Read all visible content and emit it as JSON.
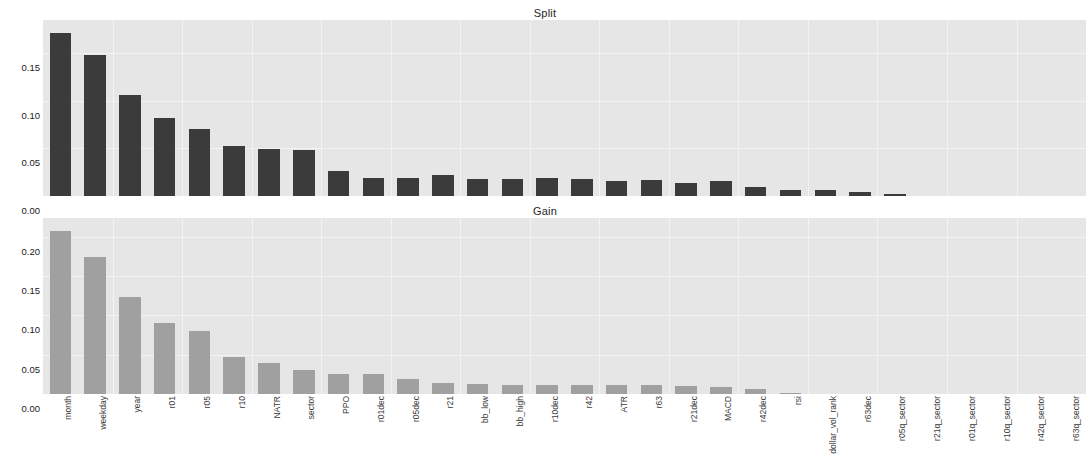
{
  "figure": {
    "width": 1090,
    "height": 472,
    "background": "#ffffff",
    "plot_background": "#e6e6e6",
    "grid_color": "#f3f3f3"
  },
  "panels": [
    {
      "id": "split",
      "title": "Split",
      "bar_color": "#3b3b3b",
      "ylim": [
        0,
        0.1845
      ],
      "yticks": [
        "0.00",
        "0.05",
        "0.10",
        "0.15"
      ],
      "ytick_values": [
        0.0,
        0.05,
        0.1,
        0.15
      ]
    },
    {
      "id": "gain",
      "title": "Gain",
      "bar_color": "#a0a0a0",
      "ylim": [
        0,
        0.224
      ],
      "yticks": [
        "0.00",
        "0.05",
        "0.10",
        "0.15",
        "0.20"
      ],
      "ytick_values": [
        0.0,
        0.05,
        0.1,
        0.15,
        0.2
      ]
    }
  ],
  "chart_data": [
    {
      "type": "bar",
      "title": "Split",
      "xlabel": "",
      "ylabel": "",
      "ylim": [
        0,
        0.1845
      ],
      "yticks": [
        0.0,
        0.05,
        0.1,
        0.15
      ],
      "grid": true,
      "bar_color": "#3b3b3b",
      "orientation": "vertical",
      "categories": [
        "month",
        "weekday",
        "year",
        "r01",
        "r05",
        "r10",
        "NATR",
        "sector",
        "PPO",
        "r01dec",
        "r05dec",
        "r21",
        "bb_low",
        "bb_high",
        "r10dec",
        "r42",
        "ATR",
        "r63",
        "r21dec",
        "MACD",
        "r42dec",
        "rsi",
        "dollar_vol_rank",
        "r63dec",
        "r05q_sector",
        "r21q_sector",
        "r01q_sector",
        "r10q_sector",
        "r42q_sector",
        "r63q_sector"
      ],
      "values": [
        0.171,
        0.148,
        0.106,
        0.082,
        0.07,
        0.052,
        0.049,
        0.048,
        0.026,
        0.019,
        0.019,
        0.022,
        0.018,
        0.018,
        0.019,
        0.018,
        0.016,
        0.017,
        0.014,
        0.016,
        0.01,
        0.006,
        0.006,
        0.004,
        0.002,
        0.0,
        0.0,
        0.0,
        0.0,
        0.0
      ]
    },
    {
      "type": "bar",
      "title": "Gain",
      "xlabel": "",
      "ylabel": "",
      "ylim": [
        0,
        0.224
      ],
      "yticks": [
        0.0,
        0.05,
        0.1,
        0.15,
        0.2
      ],
      "grid": true,
      "bar_color": "#a0a0a0",
      "orientation": "vertical",
      "categories": [
        "month",
        "weekday",
        "year",
        "r01",
        "r05",
        "r10",
        "NATR",
        "sector",
        "PPO",
        "r01dec",
        "r05dec",
        "r21",
        "bb_low",
        "bb_high",
        "r10dec",
        "r42",
        "ATR",
        "r63",
        "r21dec",
        "MACD",
        "r42dec",
        "rsi",
        "dollar_vol_rank",
        "r63dec",
        "r05q_sector",
        "r21q_sector",
        "r01q_sector",
        "r10q_sector",
        "r42q_sector",
        "r63q_sector"
      ],
      "values": [
        0.208,
        0.174,
        0.123,
        0.09,
        0.08,
        0.047,
        0.04,
        0.03,
        0.026,
        0.025,
        0.019,
        0.014,
        0.013,
        0.012,
        0.012,
        0.012,
        0.011,
        0.011,
        0.01,
        0.009,
        0.006,
        0.001,
        0.0,
        0.0,
        0.0,
        0.0,
        0.0,
        0.0,
        0.0,
        0.0
      ]
    }
  ],
  "x_labels": [
    "month",
    "weekday",
    "year",
    "r01",
    "r05",
    "r10",
    "NATR",
    "sector",
    "PPO",
    "r01dec",
    "r05dec",
    "r21",
    "bb_low",
    "bb_high",
    "r10dec",
    "r42",
    "ATR",
    "r63",
    "r21dec",
    "MACD",
    "r42dec",
    "rsi",
    "dollar_vol_rank",
    "r63dec",
    "r05q_sector",
    "r21q_sector",
    "r01q_sector",
    "r10q_sector",
    "r42q_sector",
    "r63q_sector"
  ]
}
